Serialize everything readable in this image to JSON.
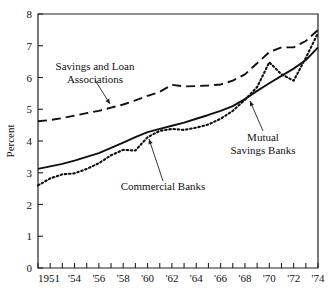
{
  "chart_data": {
    "type": "line",
    "title": "",
    "xlabel": "",
    "ylabel": "Percent",
    "xlim": [
      1951,
      1974
    ],
    "ylim": [
      0,
      8
    ],
    "grid": false,
    "legend_position": "inline-annotations",
    "y_ticks": [
      "0",
      "1",
      "2",
      "3",
      "4",
      "5",
      "6",
      "7",
      "8"
    ],
    "y_tick_values": [
      0,
      1,
      2,
      3,
      4,
      5,
      6,
      7,
      8
    ],
    "x_tick_values": [
      1951,
      1952,
      1953,
      1954,
      1955,
      1956,
      1957,
      1958,
      1959,
      1960,
      1961,
      1962,
      1963,
      1964,
      1965,
      1966,
      1967,
      1968,
      1969,
      1970,
      1971,
      1972,
      1973,
      1974
    ],
    "x_tick_labels": [
      "1951",
      "",
      "",
      "'54",
      "",
      "'56",
      "",
      "'58",
      "",
      "'60",
      "",
      "'62",
      "",
      "'64",
      "",
      "'66",
      "",
      "'68",
      "",
      "'70",
      "",
      "'72",
      "",
      "'74"
    ],
    "x": [
      1951,
      1952,
      1953,
      1954,
      1955,
      1956,
      1957,
      1958,
      1959,
      1960,
      1961,
      1962,
      1963,
      1964,
      1965,
      1966,
      1967,
      1968,
      1969,
      1970,
      1971,
      1972,
      1973,
      1974
    ],
    "series": [
      {
        "name": "Savings and Loan Associations",
        "style": "dashed",
        "color": "#111111",
        "values": [
          4.62,
          4.66,
          4.72,
          4.8,
          4.88,
          4.95,
          5.05,
          5.15,
          5.28,
          5.42,
          5.55,
          5.77,
          5.72,
          5.73,
          5.75,
          5.78,
          5.9,
          6.1,
          6.45,
          6.8,
          6.95,
          6.95,
          7.15,
          7.5
        ]
      },
      {
        "name": "Commercial Banks",
        "style": "solid",
        "color": "#111111",
        "values": [
          3.12,
          3.2,
          3.28,
          3.38,
          3.5,
          3.62,
          3.78,
          3.95,
          4.12,
          4.28,
          4.38,
          4.48,
          4.58,
          4.7,
          4.82,
          4.95,
          5.1,
          5.32,
          5.58,
          5.82,
          6.05,
          6.28,
          6.55,
          6.95
        ]
      },
      {
        "name": "Mutual Savings Banks",
        "style": "dotted",
        "color": "#111111",
        "values": [
          2.6,
          2.82,
          2.95,
          2.98,
          3.12,
          3.3,
          3.55,
          3.72,
          3.7,
          4.12,
          4.32,
          4.38,
          4.35,
          4.42,
          4.52,
          4.7,
          4.95,
          5.3,
          5.7,
          6.48,
          6.1,
          5.9,
          6.62,
          7.4
        ]
      }
    ],
    "annotations": [
      {
        "name": "savings-and-loan-label",
        "lines": [
          "Savings and Loan",
          "Associations"
        ],
        "text_x": 95,
        "text_y": 70,
        "leader_from": [
          95,
          80
        ],
        "leader_to": [
          110,
          104
        ]
      },
      {
        "name": "commercial-banks-label",
        "lines": [
          "Commercial Banks"
        ],
        "text_x": 163,
        "text_y": 190,
        "leader_from": [
          163,
          181
        ],
        "leader_to": [
          149,
          139
        ]
      },
      {
        "name": "mutual-savings-banks-label",
        "lines": [
          "Mutual",
          "Savings Banks"
        ],
        "text_x": 263,
        "text_y": 141,
        "leader_from": [
          263,
          131
        ],
        "leader_to": [
          250,
          101
        ]
      }
    ]
  }
}
